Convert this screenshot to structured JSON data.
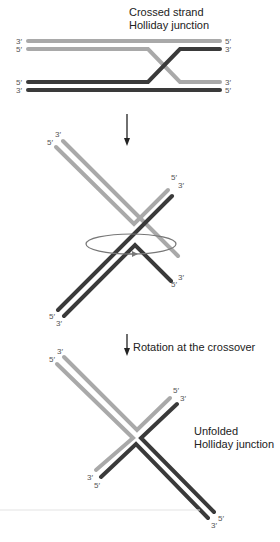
{
  "colors": {
    "light_strand": "#a9a9a9",
    "dark_strand": "#3a3a3a",
    "arrow": "#222222",
    "rotation_ellipse": "#777777"
  },
  "top_panel": {
    "title_line1": "Crossed strand",
    "title_line2": "Holliday junction",
    "labels_left": [
      "3′",
      "5′",
      "5′",
      "3′"
    ],
    "labels_right": [
      "5′",
      "3′",
      "3′",
      "5′"
    ]
  },
  "middle_panel": {
    "labels": {
      "ul_outer": "5′",
      "ul_inner": "3′",
      "ur_outer": "5′",
      "ur_inner": "3′",
      "lr_outer": "3′",
      "lr_inner": "5′",
      "ll_outer": "5′",
      "ll_inner": "3′"
    }
  },
  "arrow2_label": "Rotation at the crossover",
  "bottom_panel": {
    "title_line1": "Unfolded",
    "title_line2": "Holliday junction",
    "labels": {
      "ul_outer": "5′",
      "ul_inner": "3′",
      "ur_outer": "5′",
      "ur_inner": "3′",
      "ll_outer": "3′",
      "ll_inner": "5′",
      "lr_outer": "5′",
      "lr_inner": "3′"
    }
  }
}
